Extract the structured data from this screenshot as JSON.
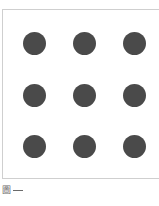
{
  "figure": {
    "frame_color": "#cfcfcf",
    "dot_color": "#4a4a4a",
    "grid": {
      "rows": 3,
      "cols": 3
    },
    "dots": [
      {
        "row": 1,
        "col": 1,
        "cx": 34,
        "cy": 43
      },
      {
        "row": 1,
        "col": 2,
        "cx": 84,
        "cy": 43
      },
      {
        "row": 1,
        "col": 3,
        "cx": 134,
        "cy": 43
      },
      {
        "row": 2,
        "col": 1,
        "cx": 34,
        "cy": 95
      },
      {
        "row": 2,
        "col": 2,
        "cx": 84,
        "cy": 95
      },
      {
        "row": 2,
        "col": 3,
        "cx": 134,
        "cy": 95
      },
      {
        "row": 3,
        "col": 1,
        "cx": 34,
        "cy": 146
      },
      {
        "row": 3,
        "col": 2,
        "cx": 84,
        "cy": 146
      },
      {
        "row": 3,
        "col": 3,
        "cx": 134,
        "cy": 146
      }
    ]
  },
  "caption": {
    "glyph": "圖",
    "dash": "—"
  }
}
